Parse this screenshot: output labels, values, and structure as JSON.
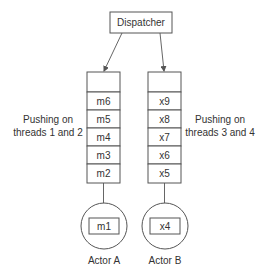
{
  "dispatcher": {
    "label": "Dispatcher"
  },
  "queues": [
    {
      "name": "queue-a",
      "cells": [
        "",
        "m6",
        "m5",
        "m4",
        "m3",
        "m2"
      ],
      "side_label": [
        "Pushing on",
        "threads 1 and 2"
      ]
    },
    {
      "name": "queue-b",
      "cells": [
        "",
        "x9",
        "x8",
        "x7",
        "x6",
        "x5"
      ],
      "side_label": [
        "Pushing on",
        "threads 3 and 4"
      ]
    }
  ],
  "actors": [
    {
      "label": "Actor A",
      "current_message": "m1"
    },
    {
      "label": "Actor B",
      "current_message": "x4"
    }
  ],
  "colors": {
    "stroke": "#555555",
    "text": "#333333",
    "background": "#ffffff"
  }
}
